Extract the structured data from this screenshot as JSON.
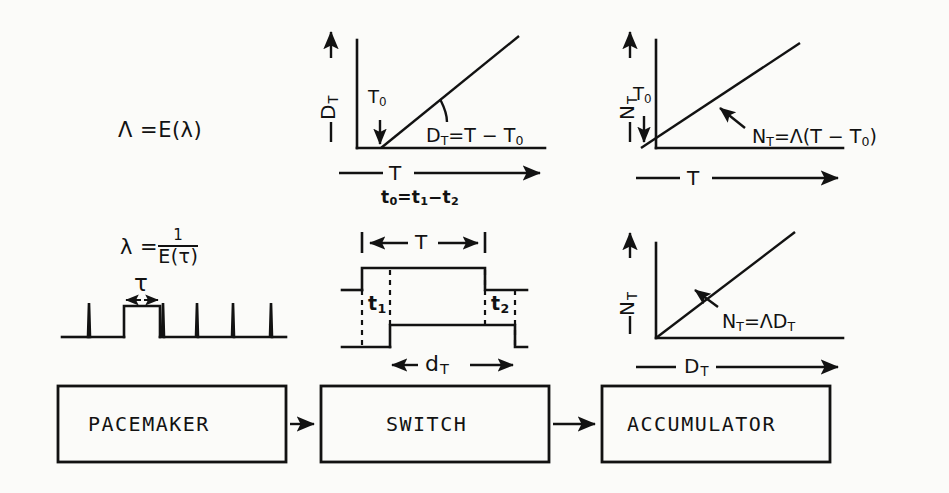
{
  "diagram": {
    "ink_color": "#121212",
    "paper_color": "#fbfbf9"
  },
  "equations": {
    "lambda_capital": "Λ =E(λ)",
    "lambda_small_lhs": "λ =",
    "lambda_small_num": "1",
    "lambda_small_den": "E(τ)"
  },
  "pulse_train": {
    "name": "pacemaker-pulse-train",
    "tau_label": "τ"
  },
  "graph_dt": {
    "name": "graph-dt-vs-t",
    "y_axis_label": "D",
    "y_axis_sub": "T",
    "x_axis_label": "T",
    "origin_marker": "T",
    "origin_marker_sub": "0",
    "curve_equation": "Dᴛ =T−T₀",
    "curve_eq_main": "D",
    "curve_eq_sub": "T",
    "curve_eq_rest": "=T − T",
    "curve_eq_rest_sub": "0",
    "footnote": "t₀ = t₁ − t₂",
    "footnote_parts": {
      "a": "t",
      "a_sub": "0",
      "eq": "=",
      "b": "t",
      "b_sub": "1",
      "minus": "−",
      "c": "t",
      "c_sub": "2"
    }
  },
  "graph_nt_t": {
    "name": "graph-nt-vs-t",
    "y_axis_label": "N",
    "y_axis_sub": "T",
    "x_axis_label": "T",
    "origin_marker": "T",
    "origin_marker_sub": "0",
    "curve_eq_main": "N",
    "curve_eq_sub": "T",
    "curve_eq_rest": "=Λ(T − T",
    "curve_eq_rest_sub": "0",
    "curve_eq_tail": ")"
  },
  "switch_timing": {
    "name": "switch-timing-diagram",
    "top_span_label": "T",
    "bottom_span_label": "d",
    "bottom_span_sub": "T",
    "left_gap_label": "t",
    "left_gap_sub": "1",
    "right_gap_label": "t",
    "right_gap_sub": "2"
  },
  "graph_nt_dt": {
    "name": "graph-nt-vs-dt",
    "y_axis_label": "N",
    "y_axis_sub": "T",
    "x_axis_label": "D",
    "x_axis_sub": "T",
    "curve_eq_main": "N",
    "curve_eq_sub": "T",
    "curve_eq_rest": "=ΛD",
    "curve_eq_rest_sub": "T"
  },
  "block_diagram": {
    "name": "block-flow-diagram",
    "blocks": [
      {
        "label": "PACEMAKER",
        "name": "block-pacemaker"
      },
      {
        "label": "SWITCH",
        "name": "block-switch"
      },
      {
        "label": "ACCUMULATOR",
        "name": "block-accumulator"
      }
    ],
    "connector_count": 2
  }
}
